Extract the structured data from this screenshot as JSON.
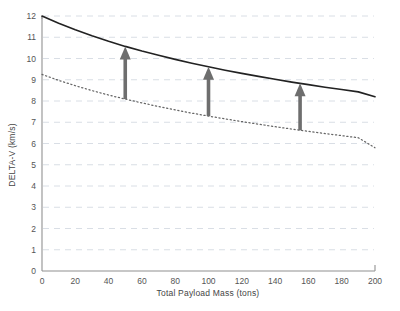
{
  "chart_data": {
    "type": "line",
    "title": "",
    "xlabel": "Total Payload Mass (tons)",
    "ylabel": "DELTA-V (km/s)",
    "xlim": [
      0,
      200
    ],
    "ylim": [
      0,
      12
    ],
    "xticks": [
      0,
      20,
      40,
      60,
      80,
      100,
      120,
      140,
      160,
      180,
      200
    ],
    "xtick_labels": [
      "0",
      "20",
      "40",
      "60",
      "80",
      "100",
      "120",
      "140",
      "160",
      "180",
      "200"
    ],
    "yticks": [
      0,
      1,
      2,
      3,
      4,
      5,
      6,
      7,
      8,
      9,
      10,
      11,
      12
    ],
    "ytick_labels": [
      "0",
      "1",
      "2",
      "3",
      "4",
      "5",
      "6",
      "7",
      "8",
      "9",
      "10",
      "11",
      "12"
    ],
    "grid": "horizontal-dashed",
    "legend": "none",
    "series": [
      {
        "name": "upper-curve",
        "style": "solid",
        "color": "#222222",
        "x": [
          0,
          10,
          20,
          30,
          40,
          50,
          60,
          70,
          80,
          90,
          100,
          110,
          120,
          130,
          140,
          150,
          160,
          170,
          180,
          190,
          200
        ],
        "y": [
          12.0,
          11.66,
          11.35,
          11.07,
          10.81,
          10.57,
          10.35,
          10.15,
          9.96,
          9.78,
          9.61,
          9.45,
          9.3,
          9.16,
          9.02,
          8.89,
          8.77,
          8.65,
          8.54,
          8.43,
          8.2
        ]
      },
      {
        "name": "lower-curve",
        "style": "dotted",
        "color": "#666666",
        "x": [
          0,
          10,
          20,
          30,
          40,
          50,
          60,
          70,
          80,
          90,
          100,
          110,
          120,
          130,
          140,
          150,
          160,
          170,
          180,
          190,
          200
        ],
        "y": [
          9.25,
          8.97,
          8.72,
          8.49,
          8.28,
          8.09,
          7.91,
          7.74,
          7.58,
          7.43,
          7.29,
          7.16,
          7.03,
          6.91,
          6.79,
          6.68,
          6.57,
          6.47,
          6.37,
          6.27,
          5.8
        ]
      }
    ],
    "annotations": [
      {
        "name": "delta-arrow-1",
        "kind": "up-arrow",
        "x": 50,
        "y_start": 8.09,
        "y_end": 10.57,
        "color": "#6e6e6e"
      },
      {
        "name": "delta-arrow-2",
        "kind": "up-arrow",
        "x": 100,
        "y_start": 7.29,
        "y_end": 9.61,
        "color": "#6e6e6e"
      },
      {
        "name": "delta-arrow-3",
        "kind": "up-arrow",
        "x": 155,
        "y_start": 6.62,
        "y_end": 8.83,
        "color": "#6e6e6e"
      }
    ]
  }
}
